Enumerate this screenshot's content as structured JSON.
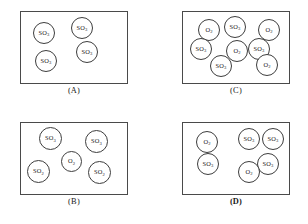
{
  "figure": {
    "panels": [
      {
        "caption": "(A)",
        "caption_bold": false,
        "box": {
          "x": 20,
          "y": 11,
          "w": 108,
          "h": 73
        },
        "caption_y": 86,
        "molecules": [
          {
            "label": "SO",
            "sub": "3",
            "x": 33,
            "y": 22,
            "d": 22
          },
          {
            "label": "SO",
            "sub": "3",
            "x": 71,
            "y": 17,
            "d": 22
          },
          {
            "label": "SO",
            "sub": "3",
            "x": 76,
            "y": 41,
            "d": 22
          },
          {
            "label": "SO",
            "sub": "3",
            "x": 35,
            "y": 50,
            "d": 22
          }
        ]
      },
      {
        "caption": "(C)",
        "caption_bold": false,
        "box": {
          "x": 182,
          "y": 11,
          "w": 108,
          "h": 73
        },
        "caption_y": 86,
        "molecules": [
          {
            "label": "O",
            "sub": "2",
            "x": 198,
            "y": 19,
            "d": 22
          },
          {
            "label": "SO",
            "sub": "3",
            "x": 224,
            "y": 16,
            "d": 22
          },
          {
            "label": "O",
            "sub": "2",
            "x": 258,
            "y": 19,
            "d": 22
          },
          {
            "label": "SO",
            "sub": "3",
            "x": 190,
            "y": 38,
            "d": 22
          },
          {
            "label": "O",
            "sub": "2",
            "x": 226,
            "y": 40,
            "d": 22
          },
          {
            "label": "SO",
            "sub": "3",
            "x": 248,
            "y": 38,
            "d": 22
          },
          {
            "label": "SO",
            "sub": "3",
            "x": 210,
            "y": 55,
            "d": 22
          },
          {
            "label": "O",
            "sub": "2",
            "x": 256,
            "y": 54,
            "d": 22
          }
        ]
      },
      {
        "caption": "(B)",
        "caption_bold": false,
        "box": {
          "x": 20,
          "y": 122,
          "w": 108,
          "h": 73
        },
        "caption_y": 197,
        "molecules": [
          {
            "label": "SO",
            "sub": "3",
            "x": 39,
            "y": 127,
            "d": 23
          },
          {
            "label": "SO",
            "sub": "3",
            "x": 85,
            "y": 130,
            "d": 23
          },
          {
            "label": "O",
            "sub": "2",
            "x": 61,
            "y": 151,
            "d": 21
          },
          {
            "label": "SO",
            "sub": "2",
            "x": 27,
            "y": 160,
            "d": 23
          },
          {
            "label": "SO",
            "sub": "2",
            "x": 88,
            "y": 161,
            "d": 23
          }
        ]
      },
      {
        "caption": "(D)",
        "caption_bold": true,
        "box": {
          "x": 182,
          "y": 122,
          "w": 108,
          "h": 73
        },
        "caption_y": 197,
        "molecules": [
          {
            "label": "O",
            "sub": "2",
            "x": 196,
            "y": 131,
            "d": 22
          },
          {
            "label": "SO",
            "sub": "3",
            "x": 238,
            "y": 128,
            "d": 22
          },
          {
            "label": "SO",
            "sub": "3",
            "x": 262,
            "y": 128,
            "d": 22
          },
          {
            "label": "SO",
            "sub": "3",
            "x": 197,
            "y": 153,
            "d": 22
          },
          {
            "label": "SO",
            "sub": "3",
            "x": 257,
            "y": 153,
            "d": 22
          },
          {
            "label": "O",
            "sub": "2",
            "x": 238,
            "y": 161,
            "d": 22
          }
        ]
      }
    ]
  }
}
